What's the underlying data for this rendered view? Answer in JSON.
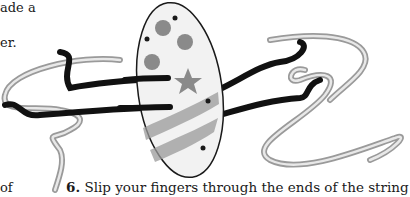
{
  "page": {
    "left_column_fragments": [
      "ade a",
      "er.",
      "of"
    ],
    "step": {
      "number": "6.",
      "text": " Slip your fingers through the ends of the string"
    }
  },
  "illustration": {
    "subject": "oval-disc-spinner-toy-on-string",
    "disc_decorations": [
      "circles",
      "star",
      "stripes",
      "dots"
    ],
    "colors": {
      "outline": "#1a1a1a",
      "disc_fill": "#f2f2f2",
      "shading": "#8a8a8a",
      "string_dark": "#111111",
      "string_light": "#9a9a9a"
    }
  }
}
